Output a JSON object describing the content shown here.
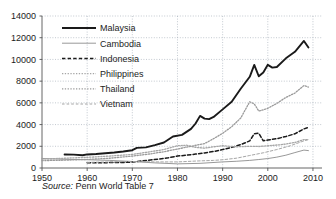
{
  "figure": {
    "source_label": "Source:",
    "source_text": "Penn World Table 7"
  },
  "chart_data": {
    "type": "line",
    "title": "",
    "subtitle": "",
    "xlabel": "",
    "ylabel": "",
    "xlim": [
      1950,
      2012
    ],
    "ylim": [
      0,
      14000
    ],
    "grid": true,
    "grid_style": "dotted",
    "legend_position": "inside-top-left",
    "x_ticks": [
      1950,
      1960,
      1970,
      1980,
      1990,
      2000,
      2010
    ],
    "x_tick_labels": [
      "1950",
      "1960",
      "1970",
      "1980",
      "1990",
      "2000",
      "2010"
    ],
    "y_ticks": [
      0,
      2000,
      4000,
      6000,
      8000,
      10000,
      12000,
      14000
    ],
    "y_tick_labels": [
      "0",
      "2000",
      "4000",
      "6000",
      "8000",
      "10000",
      "12000",
      "14000"
    ],
    "colors": {
      "malaysia": "#1a1a1a",
      "cambodia": "#8c8c8c",
      "indonesia": "#1a1a1a",
      "philippines": "#a6a6a6",
      "thailand": "#9a9a9a",
      "vietnam": "#a6a6a6",
      "grid": "#9aa4b0",
      "axis": "#555555"
    },
    "series": [
      {
        "name": "Malaysia",
        "style": "solid",
        "width": 1.9,
        "color": "#1a1a1a",
        "x": [
          1955,
          1957,
          1959,
          1960,
          1962,
          1964,
          1966,
          1968,
          1970,
          1971,
          1973,
          1975,
          1977,
          1979,
          1981,
          1983,
          1984,
          1985,
          1986,
          1987,
          1988,
          1990,
          1992,
          1994,
          1996,
          1997,
          1998,
          1999,
          2000,
          2001,
          2002,
          2004,
          2006,
          2008,
          2009
        ],
        "y": [
          1250,
          1230,
          1170,
          1250,
          1290,
          1360,
          1430,
          1520,
          1640,
          1850,
          1900,
          2100,
          2350,
          2900,
          3050,
          3600,
          4100,
          4800,
          4550,
          4500,
          4700,
          5400,
          6100,
          7300,
          8400,
          9500,
          8450,
          8800,
          9500,
          9250,
          9300,
          10100,
          10700,
          11700,
          11100
        ]
      },
      {
        "name": "Cambodia",
        "style": "solid",
        "width": 0.9,
        "color": "#8c8c8c",
        "x": [
          1950,
          1955,
          1960,
          1965,
          1970,
          1975,
          1980,
          1985,
          1990,
          1993,
          1996,
          1998,
          2000,
          2002,
          2004,
          2006,
          2008,
          2009
        ],
        "y": [
          880,
          800,
          760,
          700,
          600,
          470,
          380,
          430,
          560,
          620,
          700,
          780,
          870,
          1000,
          1180,
          1420,
          1650,
          1600
        ]
      },
      {
        "name": "Indonesia",
        "style": "dashed",
        "width": 1.5,
        "color": "#1a1a1a",
        "x": [
          1960,
          1963,
          1966,
          1969,
          1970,
          1972,
          1974,
          1976,
          1978,
          1980,
          1982,
          1984,
          1986,
          1988,
          1990,
          1992,
          1994,
          1996,
          1997,
          1998,
          1999,
          2000,
          2002,
          2004,
          2006,
          2008,
          2009
        ],
        "y": [
          480,
          490,
          500,
          520,
          560,
          640,
          740,
          830,
          950,
          1100,
          1180,
          1280,
          1390,
          1520,
          1700,
          1900,
          2150,
          2500,
          3150,
          3200,
          2500,
          2580,
          2700,
          2900,
          3150,
          3600,
          3750
        ]
      },
      {
        "name": "Philippines",
        "style": "dotted",
        "width": 1.3,
        "color": "#a6a6a6",
        "x": [
          1950,
          1955,
          1960,
          1965,
          1970,
          1974,
          1977,
          1980,
          1982,
          1984,
          1986,
          1988,
          1990,
          1993,
          1996,
          1998,
          2000,
          2003,
          2006,
          2008,
          2009
        ],
        "y": [
          820,
          900,
          980,
          1100,
          1250,
          1500,
          1700,
          2050,
          2100,
          1900,
          1830,
          1950,
          2050,
          1950,
          2000,
          1980,
          2050,
          2150,
          2350,
          2620,
          2600
        ]
      },
      {
        "name": "Thailand",
        "style": "dotted",
        "width": 1.3,
        "color": "#9a9a9a",
        "x": [
          1950,
          1955,
          1960,
          1965,
          1970,
          1974,
          1977,
          1980,
          1983,
          1986,
          1988,
          1990,
          1992,
          1994,
          1996,
          1997,
          1998,
          1999,
          2000,
          2002,
          2004,
          2006,
          2008,
          2009
        ],
        "y": [
          680,
          720,
          790,
          900,
          1100,
          1300,
          1500,
          1750,
          2000,
          2250,
          2700,
          3200,
          3800,
          4600,
          6100,
          5900,
          5250,
          5350,
          5500,
          5950,
          6500,
          6900,
          7600,
          7450
        ]
      },
      {
        "name": "Vietnam",
        "style": "dashed",
        "width": 1.0,
        "color": "#a6a6a6",
        "x": [
          1960,
          1965,
          1970,
          1975,
          1980,
          1984,
          1988,
          1990,
          1993,
          1996,
          1999,
          2002,
          2005,
          2008,
          2009
        ],
        "y": [
          520,
          560,
          600,
          560,
          560,
          640,
          700,
          760,
          900,
          1150,
          1400,
          1700,
          2050,
          2500,
          2620
        ]
      }
    ],
    "legend_entries": [
      {
        "label": "Malaysia",
        "style": "solid",
        "width": 1.9,
        "color": "#1a1a1a"
      },
      {
        "label": "Cambodia",
        "style": "solid",
        "width": 0.9,
        "color": "#8c8c8c"
      },
      {
        "label": "Indonesia",
        "style": "dashed",
        "width": 1.5,
        "color": "#1a1a1a"
      },
      {
        "label": "Philippines",
        "style": "dotted",
        "width": 1.3,
        "color": "#a6a6a6"
      },
      {
        "label": "Thailand",
        "style": "dotted",
        "width": 1.3,
        "color": "#9a9a9a"
      },
      {
        "label": "Vietnam",
        "style": "dashed",
        "width": 1.0,
        "color": "#a6a6a6"
      }
    ]
  }
}
